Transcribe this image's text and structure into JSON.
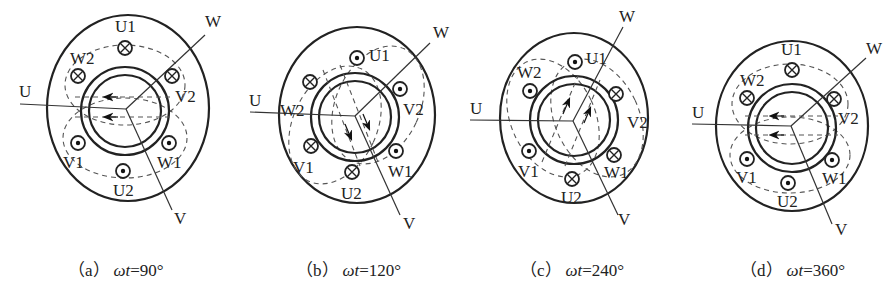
{
  "figure": {
    "panels": [
      {
        "id": "a",
        "caption_prefix": "（a）",
        "caption_var": "ωt",
        "caption_value": "=90°",
        "axis_labels": {
          "U": "U",
          "V": "V",
          "W": "W"
        },
        "field_direction": "left",
        "slots": [
          {
            "name": "U1",
            "current": "in"
          },
          {
            "name": "W2",
            "current": "in"
          },
          {
            "name": "V2",
            "current": "in"
          },
          {
            "name": "V1",
            "current": "out"
          },
          {
            "name": "W1",
            "current": "out"
          },
          {
            "name": "U2",
            "current": "out"
          }
        ]
      },
      {
        "id": "b",
        "caption_prefix": "（b）",
        "caption_var": "ωt",
        "caption_value": "=120°",
        "axis_labels": {
          "U": "U",
          "V": "V",
          "W": "W"
        },
        "field_direction": "down-right",
        "slots": [
          {
            "name": "U1",
            "current": "out"
          },
          {
            "name": "W2",
            "current": "in"
          },
          {
            "name": "V2",
            "current": "out"
          },
          {
            "name": "V1",
            "current": "in"
          },
          {
            "name": "W1",
            "current": "out"
          },
          {
            "name": "U2",
            "current": "in"
          }
        ]
      },
      {
        "id": "c",
        "caption_prefix": "（c）",
        "caption_var": "ωt",
        "caption_value": "=240°",
        "axis_labels": {
          "U": "U",
          "V": "V",
          "W": "W"
        },
        "field_direction": "up-right",
        "slots": [
          {
            "name": "U1",
            "current": "out"
          },
          {
            "name": "W2",
            "current": "out"
          },
          {
            "name": "V2",
            "current": "in"
          },
          {
            "name": "V1",
            "current": "out"
          },
          {
            "name": "W1",
            "current": "in"
          },
          {
            "name": "U2",
            "current": "in"
          }
        ]
      },
      {
        "id": "d",
        "caption_prefix": "（d）",
        "caption_var": "ωt",
        "caption_value": "=360°",
        "axis_labels": {
          "U": "U",
          "V": "V",
          "W": "W"
        },
        "field_direction": "left",
        "slots": [
          {
            "name": "U1",
            "current": "in"
          },
          {
            "name": "W2",
            "current": "in"
          },
          {
            "name": "V2",
            "current": "in"
          },
          {
            "name": "V1",
            "current": "out"
          },
          {
            "name": "W1",
            "current": "out"
          },
          {
            "name": "U2",
            "current": "out"
          }
        ]
      }
    ],
    "legend": {
      "in_symbol": "⊗",
      "out_symbol": "⊙"
    },
    "colors": {
      "line": "#222222",
      "background": "#ffffff"
    }
  }
}
